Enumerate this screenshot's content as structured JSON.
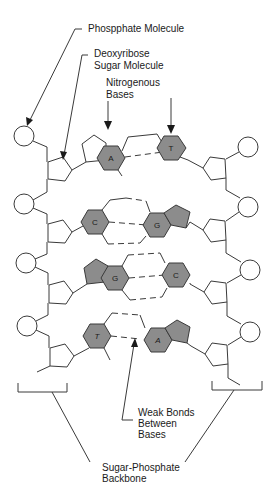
{
  "diagram": {
    "labels": {
      "phosphate": "Phospphate Molecule",
      "sugar_line1": "Deoxyribose",
      "sugar_line2": "Sugar Molecule",
      "bases_line1": "Nitrogenous",
      "bases_line2": "Bases",
      "weak_line1": "Weak Bonds",
      "weak_line2": "Between",
      "weak_line3": "Bases",
      "backbone_line1": "Sugar-Phosphate",
      "backbone_line2": "Backbone"
    },
    "base_pairs": [
      {
        "left": "A",
        "right": "T"
      },
      {
        "left": "C",
        "right": "G"
      },
      {
        "left": "G",
        "right": "C"
      },
      {
        "left": "T",
        "right": "A"
      }
    ],
    "colors": {
      "base_fill": "#8c8c8c",
      "stroke": "#3a3a3a",
      "background": "#ffffff"
    }
  }
}
